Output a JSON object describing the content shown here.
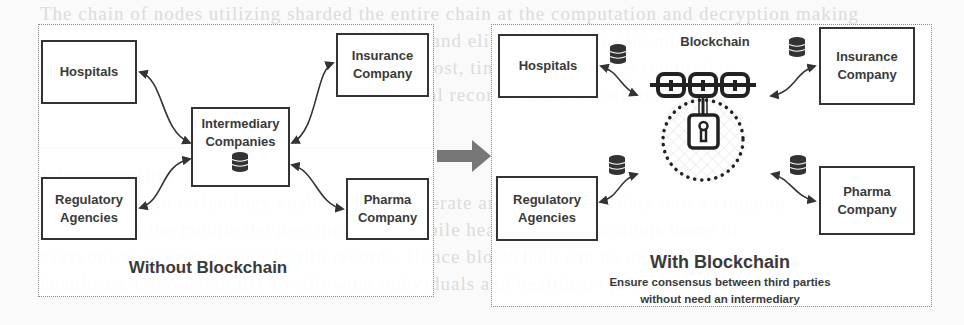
{
  "background_text": [
    "The chain of nodes utilizing sharded the entire chain at the computation and decryption making",
    "with a blockchain patient to maintain control and eliminate man-in-the-middle",
    "for example, with records, but decreases the cost, time, and resources required to",
    "a more secure environment for sharing medical records, and conducting payment",
    "transaction",
    "",
    "Interoperability",
    "The blockchain technology enables to interoperate and standardize data into a common",
    "format from the mobile devices including mobile healthcare applications home of",
    "everyone to access to their health records. Hence blockchain can be unique to",
    "healthcare interoperability by allowing individuals and healthcare providers to access"
  ],
  "transition_arrow": {
    "color": "#777777"
  },
  "without": {
    "title": "Without Blockchain",
    "nodes": {
      "hospitals": "Hospitals",
      "insurance": [
        "Insurance",
        "Company"
      ],
      "intermediary": [
        "Intermediary",
        "Companies"
      ],
      "regulatory": [
        "Regulatory",
        "Agencies"
      ],
      "pharma": [
        "Pharma",
        "Company"
      ]
    }
  },
  "with": {
    "title": "With Blockchain",
    "subtitle_line1": "Ensure consensus between third parties",
    "subtitle_line2": "without need an intermediary",
    "center_label": "Blockchain",
    "nodes": {
      "hospitals": "Hospitals",
      "insurance": [
        "Insurance",
        "Company"
      ],
      "regulatory": [
        "Regulatory",
        "Agencies"
      ],
      "pharma": [
        "Pharma",
        "Company"
      ]
    }
  }
}
